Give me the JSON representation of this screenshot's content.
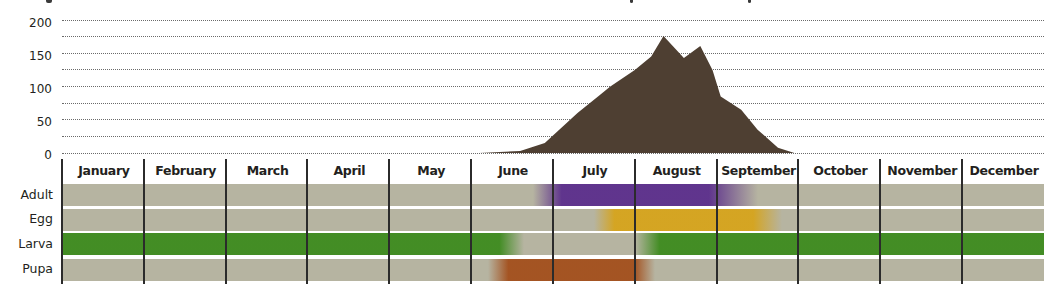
{
  "chart_data": [
    {
      "type": "area",
      "title": "",
      "xlabel": "",
      "ylabel": "",
      "ylim": [
        0,
        200
      ],
      "yticks": [
        0,
        50,
        100,
        150,
        200
      ],
      "grid": true,
      "grid_step": 25,
      "color": "#4e3f32",
      "x_unit": "month (fractional, 0 = start of January)",
      "points": [
        {
          "x": 5.1,
          "y": 0
        },
        {
          "x": 5.6,
          "y": 3
        },
        {
          "x": 5.9,
          "y": 15
        },
        {
          "x": 6.3,
          "y": 60
        },
        {
          "x": 6.55,
          "y": 85
        },
        {
          "x": 6.7,
          "y": 100
        },
        {
          "x": 7.0,
          "y": 125
        },
        {
          "x": 7.2,
          "y": 145
        },
        {
          "x": 7.35,
          "y": 176
        },
        {
          "x": 7.6,
          "y": 143
        },
        {
          "x": 7.8,
          "y": 161
        },
        {
          "x": 7.95,
          "y": 125
        },
        {
          "x": 8.05,
          "y": 85
        },
        {
          "x": 8.3,
          "y": 65
        },
        {
          "x": 8.5,
          "y": 35
        },
        {
          "x": 8.75,
          "y": 8
        },
        {
          "x": 8.95,
          "y": 0
        }
      ]
    },
    {
      "type": "table",
      "title": "Life stage phenology",
      "categories": [
        "January",
        "February",
        "March",
        "April",
        "May",
        "June",
        "July",
        "August",
        "September",
        "October",
        "November",
        "December"
      ],
      "series": [
        {
          "name": "Adult",
          "color": "#5b2e8c",
          "present_from": 5.75,
          "present_to": 8.5,
          "fade_in_start": 5.75,
          "full_start": 6.1,
          "full_end": 7.9,
          "fade_out_end": 8.5
        },
        {
          "name": "Egg",
          "color": "#d6a41c",
          "present_from": 6.5,
          "present_to": 8.8,
          "fade_in_start": 6.5,
          "full_start": 6.75,
          "full_end": 8.45,
          "fade_out_end": 8.8
        },
        {
          "name": "Larva",
          "color": "#3d8b1e",
          "segments": [
            {
              "from": 0,
              "to": 5.35,
              "fade_out_end": 5.65
            },
            {
              "from": 7.0,
              "fade_in_end": 7.3,
              "to": 12
            }
          ]
        },
        {
          "name": "Pupa",
          "color": "#a34f1c",
          "present_from": 5.2,
          "present_to": 7.25,
          "fade_in_start": 5.2,
          "full_start": 5.45,
          "full_end": 7.0,
          "fade_out_end": 7.25
        }
      ]
    }
  ],
  "axis": {
    "y_ticks": [
      {
        "label": "200",
        "value": 200
      },
      {
        "label": "150",
        "value": 150
      },
      {
        "label": "100",
        "value": 100
      },
      {
        "label": "50",
        "value": 50
      },
      {
        "label": "0",
        "value": 0
      }
    ]
  },
  "months": [
    "January",
    "February",
    "March",
    "April",
    "May",
    "June",
    "July",
    "August",
    "September",
    "October",
    "November",
    "December"
  ],
  "rows": [
    {
      "label": "Adult"
    },
    {
      "label": "Egg"
    },
    {
      "label": "Larva"
    },
    {
      "label": "Pupa"
    }
  ],
  "colors": {
    "background_bar": "#b6b4a1",
    "area": "#4e3f32",
    "adult": "#5b2e8c",
    "egg": "#d6a41c",
    "larva": "#3d8b1e",
    "pupa": "#a34f1c"
  }
}
